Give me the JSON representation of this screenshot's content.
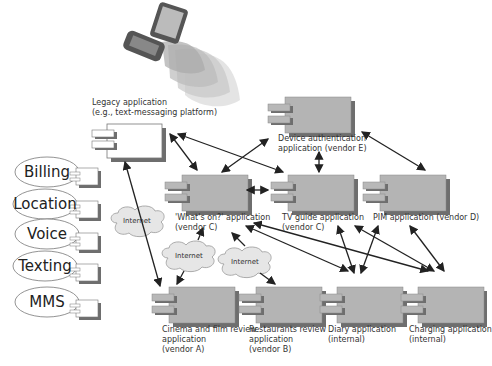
{
  "device": {
    "name": "mobile-device",
    "description": "handheld device emitting signal waves"
  },
  "legacy": {
    "label_line1": "Legacy application",
    "label_line2": "(e.g., text-messaging platform)"
  },
  "services": [
    "Billing",
    "Location",
    "Voice",
    "Texting",
    "MMS"
  ],
  "components": {
    "device_auth": {
      "line1": "Device authentication",
      "line2": "application (vendor E)"
    },
    "whats_on": {
      "line1": "'What's on?' application",
      "line2": "(vendor C)"
    },
    "tv_guide": {
      "line1": "TV guide application",
      "line2": "(vendor C)"
    },
    "pim": {
      "line1": "PIM application (vendor D)",
      "line2": ""
    },
    "cinema": {
      "line1": "Cinema and film review",
      "line2": "application",
      "line3": "(vendor A)"
    },
    "restaurants": {
      "line1": "Restaurants review",
      "line2": "application",
      "line3": "(vendor B)"
    },
    "diary": {
      "line1": "Diary application",
      "line2": "(internal)"
    },
    "charging": {
      "line1": "Charging application",
      "line2": "(internal)"
    }
  },
  "clouds": [
    "Internet",
    "Internet",
    "Internet"
  ],
  "colors": {
    "component_fill": "#b4b4b4",
    "component_shadow": "#6e6e6e",
    "legacy_fill": "#ffffff",
    "cloud_fill": "#e6e6e6",
    "arrow": "#222222"
  }
}
